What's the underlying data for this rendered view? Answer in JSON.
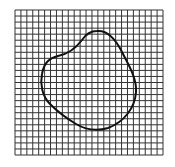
{
  "diagram": {
    "type": "grid-with-closed-curve",
    "grid": {
      "x": 15,
      "y": 10,
      "width": 148,
      "height": 145,
      "cell_size": 6,
      "line_color": "#333333",
      "background": "#ffffff"
    },
    "curve": {
      "stroke": "#111111",
      "stroke_width": 2,
      "path": "M97 31 C108 30 116 40 122 52 C128 64 137 78 136 92 C135 108 124 122 108 128 C98 131 86 130 76 124 C66 118 58 112 50 104 C42 96 40 84 42 74 C44 62 50 58 58 56 C68 54 76 48 82 40 C86 34 92 31 97 31 Z"
    },
    "top_text_fragment": ""
  }
}
